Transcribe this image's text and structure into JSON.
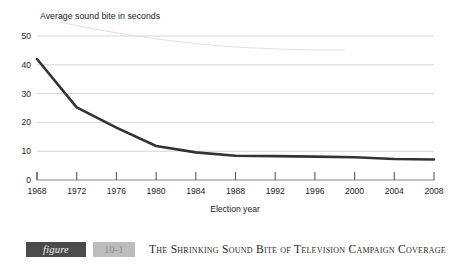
{
  "chart_data": {
    "type": "line",
    "title": "",
    "xlabel": "Election year",
    "ylabel": "Average sound bite in seconds",
    "x": [
      1968,
      1972,
      1976,
      1980,
      1984,
      1988,
      1992,
      1996,
      2000,
      2004,
      2008
    ],
    "values": [
      42,
      25.2,
      18.2,
      11.8,
      9.6,
      8.4,
      8.3,
      8.1,
      7.9,
      7.3,
      7.1
    ],
    "categories": [
      "1968",
      "1972",
      "1976",
      "1980",
      "1984",
      "1988",
      "1992",
      "1996",
      "2000",
      "2004",
      "2008"
    ],
    "series": [
      {
        "name": "Average sound bite in seconds",
        "values": [
          42,
          25.2,
          18.2,
          11.8,
          9.6,
          8.4,
          8.3,
          8.1,
          7.9,
          7.3,
          7.1
        ]
      }
    ],
    "xlim": [
      1968,
      2008
    ],
    "ylim": [
      0,
      50
    ],
    "yticks": [
      0,
      10,
      20,
      30,
      40,
      50
    ],
    "ytick_labels": [
      "0",
      "10",
      "20",
      "30",
      "40",
      "50"
    ],
    "xticks": [
      1968,
      1972,
      1976,
      1980,
      1984,
      1988,
      1992,
      1996,
      2000,
      2004,
      2008
    ],
    "xtick_labels": [
      "1968",
      "1972",
      "1976",
      "1980",
      "1984",
      "1988",
      "1992",
      "1996",
      "2000",
      "2004",
      "2008"
    ],
    "grid": true,
    "grid_axis": "y",
    "legend": false,
    "legend_position": "none",
    "line_color": "#333333",
    "grid_color": "#d6d6d6",
    "axis_color": "#6e6e6e"
  },
  "axis": {
    "y_label": "Average sound bite in seconds",
    "x_label": "Election year"
  },
  "caption": {
    "figure_word": "figure",
    "figure_number": "10-1",
    "title": "The Shrinking Sound Bite of Television Campaign Coverage",
    "chip_color": "#4b4b4b",
    "number_chip_color": "#bdbdbd"
  }
}
